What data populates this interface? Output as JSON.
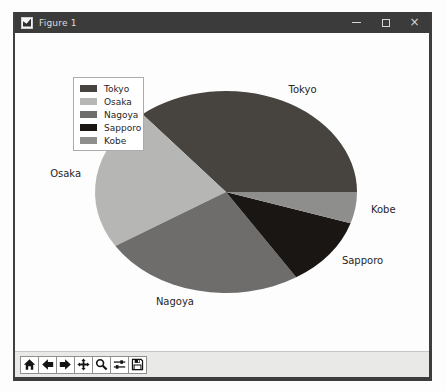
{
  "window": {
    "title": "Figure 1",
    "controls": {
      "minimize": "minimize",
      "maximize": "maximize",
      "close_glyph": "×"
    }
  },
  "chart_data": {
    "type": "pie",
    "title": "",
    "labels": [
      "Tokyo",
      "Osaka",
      "Nagoya",
      "Sapporo",
      "Kobe"
    ],
    "values": [
      36,
      23,
      25,
      11,
      5
    ],
    "value_unit": "percent-of-whole (estimated from wedge angles)",
    "colors": [
      "#474440",
      "#b6b6b4",
      "#6f6d6c",
      "#1a1614",
      "#8e8f8c"
    ],
    "start_angle_deg": 0,
    "counterclockwise": true,
    "wedge_edge": "none",
    "legend": {
      "position": "upper left",
      "entries": [
        "Tokyo",
        "Osaka",
        "Nagoya",
        "Sapporo",
        "Kobe"
      ]
    },
    "label_font_px": 10,
    "label_color": "#262626"
  },
  "toolbar": {
    "buttons": [
      {
        "id": "home",
        "icon": "home-icon"
      },
      {
        "id": "back",
        "icon": "back-arrow-icon"
      },
      {
        "id": "forward",
        "icon": "forward-arrow-icon"
      },
      {
        "id": "pan",
        "icon": "pan-arrows-icon"
      },
      {
        "id": "zoom",
        "icon": "zoom-magnifier-icon"
      },
      {
        "id": "configure-subplots",
        "icon": "sliders-icon"
      },
      {
        "id": "save",
        "icon": "save-floppy-icon"
      }
    ]
  },
  "theme": {
    "titlebar_bg": "#3b3b3b",
    "titlebar_fg": "#dcdcdc",
    "window_border": "#3d3d3d",
    "canvas_bg": "#fdfdfd",
    "toolbar_bg": "#e9e9e7",
    "button_bg": "#ffffff",
    "button_border": "#8f8f8f",
    "icon_color": "#141414",
    "legend_border": "#ababab"
  }
}
